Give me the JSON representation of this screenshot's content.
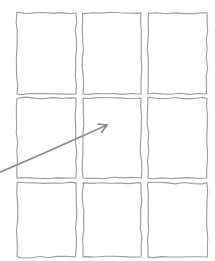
{
  "canvas": {
    "width": 215,
    "height": 261,
    "background_color": "#ffffff",
    "description": "Sketch-style 3x3 grid of blank rectangular panels with a hand-drawn arrow pointing at the center panel"
  },
  "style": {
    "panel_stroke_color": "#9d9d9d",
    "panel_fill_color": "#ffffff",
    "panel_stroke_width": 1.15,
    "arrow_color": "#8b8b8b",
    "arrow_stroke_width": 1.7,
    "sketch_wobble": true
  },
  "grid": {
    "name": "panel-grid",
    "rows": 3,
    "columns": 3,
    "cell_width": 59,
    "cell_height": 81,
    "column_x": [
      17,
      83,
      148
    ],
    "row_y": [
      13,
      98,
      183
    ],
    "cells": [
      {
        "id": "cell-r1-c1",
        "row": 1,
        "col": 1,
        "label": "",
        "x": 17,
        "y": 13,
        "w": 59,
        "h": 81,
        "highlighted": false
      },
      {
        "id": "cell-r1-c2",
        "row": 1,
        "col": 2,
        "label": "",
        "x": 83,
        "y": 13,
        "w": 58,
        "h": 81,
        "highlighted": false
      },
      {
        "id": "cell-r1-c3",
        "row": 1,
        "col": 3,
        "label": "",
        "x": 148,
        "y": 13,
        "w": 59,
        "h": 81,
        "highlighted": false
      },
      {
        "id": "cell-r2-c1",
        "row": 2,
        "col": 1,
        "label": "",
        "x": 17,
        "y": 98,
        "w": 59,
        "h": 80,
        "highlighted": false
      },
      {
        "id": "cell-r2-c2",
        "row": 2,
        "col": 2,
        "label": "",
        "x": 83,
        "y": 98,
        "w": 58,
        "h": 80,
        "highlighted": true
      },
      {
        "id": "cell-r2-c3",
        "row": 2,
        "col": 3,
        "label": "",
        "x": 148,
        "y": 98,
        "w": 59,
        "h": 80,
        "highlighted": false
      },
      {
        "id": "cell-r3-c1",
        "row": 3,
        "col": 1,
        "label": "",
        "x": 17,
        "y": 183,
        "w": 59,
        "h": 74,
        "highlighted": false
      },
      {
        "id": "cell-r3-c2",
        "row": 3,
        "col": 2,
        "label": "",
        "x": 83,
        "y": 183,
        "w": 58,
        "h": 74,
        "highlighted": false
      },
      {
        "id": "cell-r3-c3",
        "row": 3,
        "col": 3,
        "label": "",
        "x": 148,
        "y": 183,
        "w": 59,
        "h": 74,
        "highlighted": false
      }
    ]
  },
  "annotation": {
    "arrow": {
      "name": "pointer-arrow",
      "label": "",
      "color": "#8b8b8b",
      "from": {
        "x": -4,
        "y": 174
      },
      "to": {
        "x": 107,
        "y": 125
      },
      "target_cell": "cell-r2-c2",
      "head_size": 9
    }
  }
}
